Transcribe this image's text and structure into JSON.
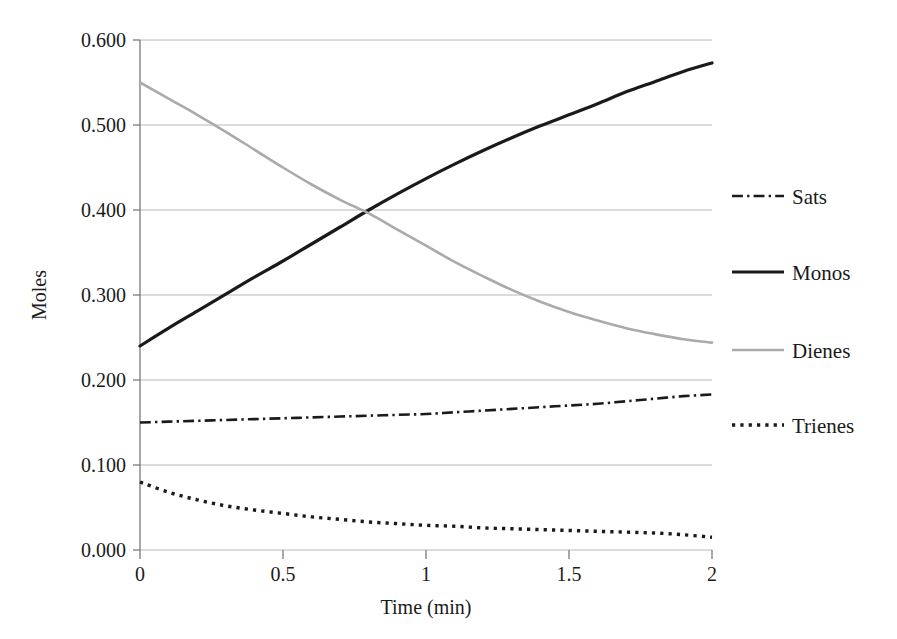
{
  "chart_data": {
    "type": "line",
    "title": "",
    "xlabel": "Time (min)",
    "ylabel": "Moles",
    "xlim": [
      0,
      2
    ],
    "ylim": [
      0.0,
      0.6
    ],
    "grid": "horizontal",
    "legend_position": "right",
    "x_ticks": [
      "0",
      "0.5",
      "1",
      "1.5",
      "2"
    ],
    "x_tick_values": [
      0,
      0.5,
      1,
      1.5,
      2
    ],
    "y_ticks": [
      "0.000",
      "0.100",
      "0.200",
      "0.300",
      "0.400",
      "0.500",
      "0.600"
    ],
    "y_tick_values": [
      0.0,
      0.1,
      0.2,
      0.3,
      0.4,
      0.5,
      0.6
    ],
    "x": [
      0,
      0.1,
      0.2,
      0.3,
      0.4,
      0.5,
      0.6,
      0.7,
      0.8,
      0.9,
      1.0,
      1.1,
      1.2,
      1.3,
      1.4,
      1.5,
      1.6,
      1.7,
      1.8,
      1.9,
      2.0
    ],
    "series": [
      {
        "name": "Sats",
        "style": "dash-dot",
        "color": "#1a1a1a",
        "width": 2.6,
        "values": [
          0.15,
          0.151,
          0.152,
          0.153,
          0.154,
          0.155,
          0.156,
          0.157,
          0.158,
          0.159,
          0.16,
          0.162,
          0.164,
          0.166,
          0.168,
          0.17,
          0.172,
          0.175,
          0.178,
          0.181,
          0.183
        ]
      },
      {
        "name": "Monos",
        "style": "solid",
        "color": "#1a1a1a",
        "width": 3.2,
        "values": [
          0.24,
          0.261,
          0.281,
          0.301,
          0.321,
          0.34,
          0.36,
          0.38,
          0.4,
          0.419,
          0.437,
          0.454,
          0.47,
          0.485,
          0.499,
          0.512,
          0.525,
          0.539,
          0.551,
          0.563,
          0.573
        ]
      },
      {
        "name": "Dienes",
        "style": "solid",
        "color": "#aaaaaa",
        "width": 2.6,
        "values": [
          0.55,
          0.531,
          0.512,
          0.492,
          0.471,
          0.45,
          0.43,
          0.412,
          0.396,
          0.377,
          0.358,
          0.339,
          0.322,
          0.306,
          0.292,
          0.28,
          0.27,
          0.261,
          0.254,
          0.248,
          0.244
        ]
      },
      {
        "name": "Trienes",
        "style": "dotted",
        "color": "#1a1a1a",
        "width": 3.4,
        "values": [
          0.08,
          0.068,
          0.059,
          0.052,
          0.047,
          0.043,
          0.039,
          0.036,
          0.033,
          0.031,
          0.029,
          0.028,
          0.026,
          0.025,
          0.024,
          0.023,
          0.022,
          0.021,
          0.02,
          0.018,
          0.015
        ]
      }
    ],
    "legend_entries": [
      {
        "label": "Sats",
        "style": "dash-dot",
        "color": "#1a1a1a"
      },
      {
        "label": "Monos",
        "style": "solid",
        "color": "#1a1a1a"
      },
      {
        "label": "Dienes",
        "style": "solid",
        "color": "#aaaaaa"
      },
      {
        "label": "Trienes",
        "style": "dotted",
        "color": "#1a1a1a"
      }
    ]
  },
  "axes": {
    "x_label": "Time (min)",
    "y_label": "Moles"
  },
  "colors": {
    "background": "#ffffff",
    "axis": "#7a7a7a",
    "grid": "#b8b8b8",
    "text": "#1a1a1a",
    "dark_series": "#1a1a1a",
    "light_series": "#aaaaaa"
  }
}
